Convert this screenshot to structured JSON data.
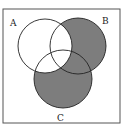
{
  "diagram": {
    "type": "venn",
    "sets": [
      {
        "name": "A",
        "cx": 45,
        "cy": 46,
        "r": 27,
        "label_x": 11,
        "label_y": 28
      },
      {
        "name": "B",
        "cx": 78,
        "cy": 46,
        "r": 28,
        "label_x": 105,
        "label_y": 25
      },
      {
        "name": "C",
        "cx": 63,
        "cy": 79,
        "r": 29,
        "label_x": 58,
        "label_y": 121
      }
    ],
    "shaded_region": "(B ∪ C) − A",
    "shade_color": "#7d7d7d",
    "frame": {
      "x": 3,
      "y": 9,
      "w": 117,
      "h": 114
    }
  },
  "labels": {
    "a": "A",
    "b": "B",
    "c": "C"
  }
}
